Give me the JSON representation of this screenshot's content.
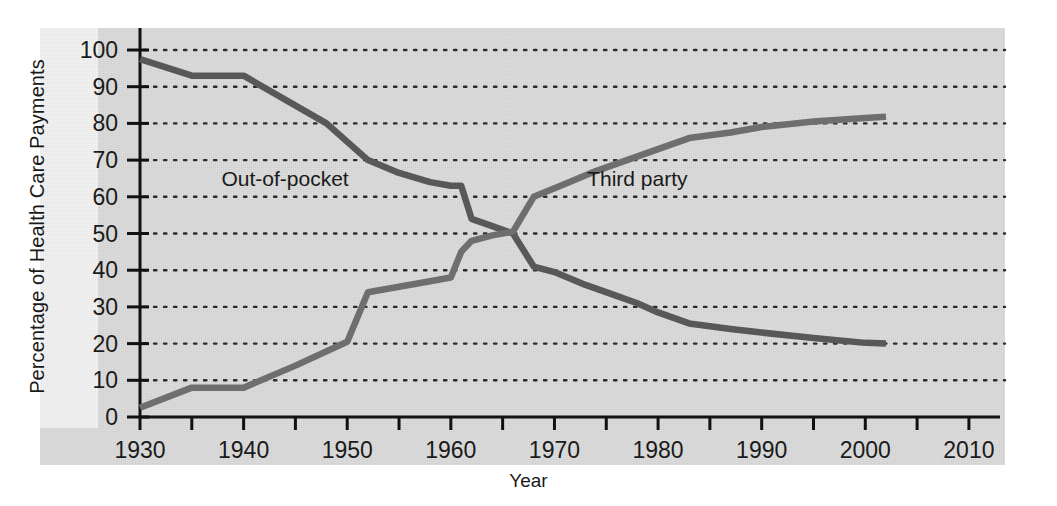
{
  "chart_data": {
    "type": "line",
    "title": "",
    "xlabel": "Year",
    "ylabel": "Percentage of Health Care Payments",
    "xlim": [
      1930,
      2013
    ],
    "ylim": [
      0,
      100
    ],
    "xticks": [
      1930,
      1935,
      1940,
      1945,
      1950,
      1955,
      1960,
      1965,
      1970,
      1975,
      1980,
      1985,
      1990,
      1995,
      2000,
      2005,
      2010
    ],
    "xtick_labels": [
      "1930",
      "",
      "1940",
      "",
      "1950",
      "",
      "1960",
      "",
      "1970",
      "",
      "1980",
      "",
      "1990",
      "",
      "2000",
      "",
      "2010"
    ],
    "xtick_labels_shown": [
      "1930",
      "1940",
      "1950",
      "1960",
      "1970",
      "1980",
      "1990",
      "2000",
      "2010"
    ],
    "yticks": [
      0,
      10,
      20,
      30,
      40,
      50,
      60,
      70,
      80,
      90,
      100
    ],
    "ytick_labels": [
      "0",
      "10",
      "20",
      "30",
      "40",
      "50",
      "60",
      "70",
      "80",
      "90",
      "100"
    ],
    "grid": "horizontal-dotted",
    "legend_position": "inline-annotations",
    "series": [
      {
        "name": "Out-of-pocket",
        "color": "#585858",
        "label_x": 1944,
        "label_y": 65,
        "x": [
          1930,
          1935,
          1940,
          1948,
          1952,
          1955,
          1958,
          1960,
          1961,
          1962,
          1964,
          1966,
          1968,
          1970,
          1973,
          1976,
          1978,
          1980,
          1983,
          1987,
          1990,
          1995,
          2000,
          2002
        ],
        "y": [
          97.5,
          93,
          93,
          80,
          70,
          66.5,
          64,
          63,
          63,
          54,
          52,
          50,
          41,
          39.5,
          36,
          33,
          31,
          28.5,
          25.5,
          24,
          23,
          21.5,
          20.2,
          20
        ]
      },
      {
        "name": "Third party",
        "color": "#6e6e6e",
        "label_x": 1978,
        "label_y": 65,
        "x": [
          1930,
          1935,
          1940,
          1945,
          1950,
          1952,
          1955,
          1958,
          1960,
          1961,
          1962,
          1964,
          1966,
          1968,
          1971,
          1974,
          1977,
          1980,
          1983,
          1987,
          1990,
          1995,
          2000,
          2002
        ],
        "y": [
          2.5,
          8,
          8,
          14,
          20.5,
          34,
          35.5,
          37,
          38,
          45,
          48,
          49.5,
          50.5,
          60,
          63.5,
          67,
          70,
          73,
          76,
          77.5,
          79,
          80.5,
          81.5,
          81.8
        ]
      }
    ]
  },
  "axis": {
    "y_title": "Percentage of Health Care Payments",
    "x_title": "Year"
  }
}
